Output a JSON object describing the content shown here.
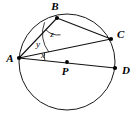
{
  "figure": {
    "kind": "circle-geometry-diagram",
    "background_color": "#ffffff",
    "stroke_color": "#111111",
    "width": 136,
    "height": 122
  },
  "circle": {
    "name": "main-circle",
    "center_label": "P",
    "center_x": 67,
    "center_y": 62,
    "radius": 48
  },
  "points": [
    {
      "label": "A",
      "x": 19,
      "y": 58,
      "label_x": 10,
      "label_y": 62,
      "on_circle": true
    },
    {
      "label": "B",
      "x": 57,
      "y": 18,
      "label_x": 55,
      "label_y": 10,
      "on_circle": true
    },
    {
      "label": "C",
      "x": 111,
      "y": 39,
      "label_x": 117,
      "label_y": 38,
      "on_circle": true
    },
    {
      "label": "D",
      "x": 115,
      "y": 68,
      "label_x": 122,
      "label_y": 74,
      "on_circle": true
    },
    {
      "label": "P",
      "x": 67,
      "y": 62,
      "label_x": 65,
      "label_y": 75,
      "on_circle": false
    }
  ],
  "segments": [
    {
      "name": "chord-AB",
      "from": "A",
      "to": "B"
    },
    {
      "name": "chord-AC",
      "from": "A",
      "to": "C"
    },
    {
      "name": "chord-AD",
      "from": "A",
      "to": "D"
    },
    {
      "name": "chord-BC",
      "from": "B",
      "to": "C"
    }
  ],
  "angles": [
    {
      "label": "y",
      "vertex": "A",
      "between": "AB and AC",
      "label_x": 38,
      "label_y": 47
    },
    {
      "label": "x",
      "vertex": "A",
      "between": "AC and AD",
      "label_x": 43,
      "label_y": 58
    },
    {
      "label": "z",
      "vertex": "B",
      "between": "BA and BC",
      "label_x": 52,
      "label_y": 37
    }
  ]
}
